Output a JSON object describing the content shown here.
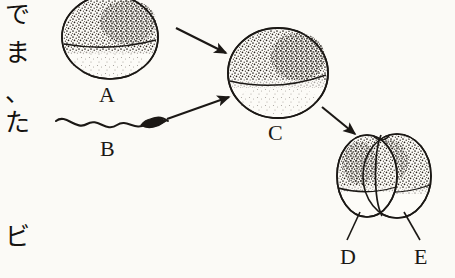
{
  "page": {
    "background_color": "#fbfaf6",
    "ink_color": "#1b1815",
    "width": 455,
    "height": 278
  },
  "vertical_text": {
    "description": "Japanese vertical text column at left edge of scanned page",
    "chars": [
      {
        "char": "で",
        "top": 2
      },
      {
        "char": "ま",
        "top": 40
      },
      {
        "char": "、",
        "top": 80
      },
      {
        "char": "た",
        "top": 110
      },
      {
        "char": "ビ",
        "top": 224
      }
    ]
  },
  "figure": {
    "caption_labels": [
      {
        "id": "label-a",
        "text": "A",
        "x": 99,
        "y": 84
      },
      {
        "id": "label-b",
        "text": "B",
        "x": 100,
        "y": 138
      },
      {
        "id": "label-c",
        "text": "C",
        "x": 268,
        "y": 122
      },
      {
        "id": "label-d",
        "text": "D",
        "x": 340,
        "y": 246
      },
      {
        "id": "label-e",
        "text": "E",
        "x": 414,
        "y": 246
      }
    ],
    "cells": [
      {
        "id": "cell-a",
        "name": "egg-cell-a",
        "cx": 110,
        "cy": 37,
        "rx": 48,
        "ry": 42,
        "stipple_fraction": 0.62
      },
      {
        "id": "cell-c",
        "name": "fertilized-egg-c",
        "cx": 278,
        "cy": 73,
        "rx": 50,
        "ry": 45,
        "stipple_fraction": 0.6
      },
      {
        "id": "cell-d",
        "name": "blastomere-d",
        "cx": 367,
        "cy": 176,
        "rx": 29,
        "ry": 41,
        "stipple_fraction": 0.6
      },
      {
        "id": "cell-e",
        "name": "blastomere-e",
        "cx": 398,
        "cy": 176,
        "rx": 33,
        "ry": 42,
        "stipple_fraction": 0.6
      }
    ],
    "sperm": {
      "id": "sperm-b",
      "name": "sperm-cell-b",
      "head_x": 158,
      "head_y": 124,
      "tail_start_x": 56,
      "tail_start_y": 122
    },
    "arrows": [
      {
        "id": "arrow-a-to-c",
        "x1": 176,
        "y1": 28,
        "x2": 229,
        "y2": 55
      },
      {
        "id": "arrow-b-to-c",
        "x1": 167,
        "y1": 119,
        "x2": 232,
        "y2": 96
      },
      {
        "id": "arrow-c-to-de",
        "x1": 322,
        "y1": 107,
        "x2": 358,
        "y2": 137
      }
    ],
    "leader_lines": [
      {
        "id": "leader-d",
        "x1": 360,
        "y1": 213,
        "x2": 348,
        "y2": 240
      },
      {
        "id": "leader-e",
        "x1": 402,
        "y1": 213,
        "x2": 420,
        "y2": 240
      }
    ]
  }
}
